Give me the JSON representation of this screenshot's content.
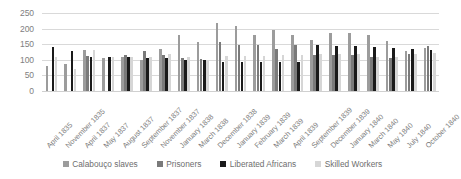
{
  "chart_data": {
    "type": "bar",
    "title": "",
    "xlabel": "",
    "ylabel": "",
    "ylim": [
      0,
      250
    ],
    "yticks": [
      0,
      50,
      100,
      150,
      200,
      250
    ],
    "grid": true,
    "legend_position": "bottom",
    "categories": [
      "April 1835",
      "November 1835",
      "April 1837",
      "May 1837",
      "August 1837",
      "September 1837",
      "November 1837",
      "January 1838",
      "March 1838",
      "December 1838",
      "January 1839",
      "February 1839",
      "March 1839",
      "April 1839",
      "September 1839",
      "December 1839",
      "January 1840",
      "March 1840",
      "May 1840",
      "July 1840",
      "October 1840"
    ],
    "series": [
      {
        "name": "Calabouço slaves",
        "color": "#9c9c9c",
        "values": [
          80,
          86,
          131,
          106,
          108,
          101,
          135,
          178,
          158,
          218,
          208,
          181,
          197,
          180,
          165,
          187,
          186,
          180,
          161,
          128,
          138
        ]
      },
      {
        "name": "Prisoners",
        "color": "#7a7a7a",
        "values": [
          null,
          null,
          113,
          null,
          116,
          127,
          116,
          105,
          104,
          158,
          148,
          146,
          134,
          148,
          116,
          117,
          117,
          110,
          105,
          119,
          143
        ]
      },
      {
        "name": "Liberated Africans",
        "color": "#1a1a1a",
        "values": [
          142,
          127,
          109,
          109,
          108,
          107,
          106,
          101,
          100,
          94,
          93,
          92,
          93,
          92,
          148,
          145,
          143,
          141,
          138,
          136,
          132
        ]
      },
      {
        "name": "Skilled Workers",
        "color": "#d6d6d6",
        "values": [
          110,
          69,
          133,
          108,
          110,
          110,
          118,
          110,
          101,
          112,
          113,
          113,
          114,
          114,
          119,
          119,
          119,
          110,
          110,
          119,
          123
        ]
      }
    ]
  },
  "legend": {
    "items": [
      {
        "label": "Calabouço slaves",
        "color": "#9c9c9c"
      },
      {
        "label": "Prisoners",
        "color": "#7a7a7a"
      },
      {
        "label": "Liberated Africans",
        "color": "#1a1a1a"
      },
      {
        "label": "Skilled Workers",
        "color": "#d6d6d6"
      }
    ]
  }
}
